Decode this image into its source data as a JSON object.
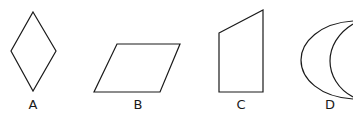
{
  "figure": {
    "shapes": [
      {
        "id": "A",
        "label": "A",
        "kind": "rhombus"
      },
      {
        "id": "B",
        "label": "B",
        "kind": "parallelogram"
      },
      {
        "id": "C",
        "label": "C",
        "kind": "right-trapezoid"
      },
      {
        "id": "D",
        "label": "D",
        "kind": "crescent"
      }
    ]
  }
}
